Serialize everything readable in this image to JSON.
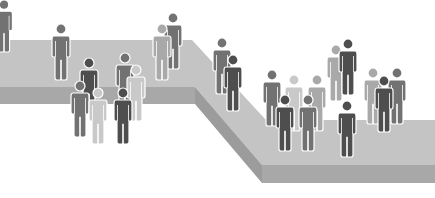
{
  "illustration": {
    "subject": "people-on-stepped-platform",
    "colors": {
      "background": "#ffffff",
      "platform_top": "#c4c4c4",
      "platform_front": "#a8a8a8",
      "platform_side": "#9c9c9c",
      "figure_outline": "#ffffff",
      "figure_dark": "#4e4e4e",
      "figure_mid": "#727272",
      "figure_light": "#a9a9a9",
      "figure_pale": "#c9c9c9"
    },
    "figures": [
      {
        "x": 4,
        "y": 0,
        "h": 52,
        "tone": "mid"
      },
      {
        "x": 61,
        "y": 24,
        "h": 56,
        "tone": "mid"
      },
      {
        "x": 173,
        "y": 13,
        "h": 56,
        "tone": "mid"
      },
      {
        "x": 162,
        "y": 24,
        "h": 56,
        "tone": "light"
      },
      {
        "x": 89,
        "y": 58,
        "h": 56,
        "tone": "dark"
      },
      {
        "x": 125,
        "y": 53,
        "h": 56,
        "tone": "mid"
      },
      {
        "x": 136,
        "y": 65,
        "h": 56,
        "tone": "pale"
      },
      {
        "x": 80,
        "y": 81,
        "h": 56,
        "tone": "mid"
      },
      {
        "x": 98,
        "y": 88,
        "h": 56,
        "tone": "pale"
      },
      {
        "x": 123,
        "y": 88,
        "h": 56,
        "tone": "dark"
      },
      {
        "x": 222,
        "y": 38,
        "h": 56,
        "tone": "mid"
      },
      {
        "x": 233,
        "y": 55,
        "h": 56,
        "tone": "dark"
      },
      {
        "x": 272,
        "y": 70,
        "h": 56,
        "tone": "mid"
      },
      {
        "x": 294,
        "y": 75,
        "h": 56,
        "tone": "pale"
      },
      {
        "x": 317,
        "y": 75,
        "h": 56,
        "tone": "light"
      },
      {
        "x": 285,
        "y": 95,
        "h": 56,
        "tone": "dark"
      },
      {
        "x": 308,
        "y": 95,
        "h": 56,
        "tone": "mid"
      },
      {
        "x": 336,
        "y": 45,
        "h": 56,
        "tone": "light"
      },
      {
        "x": 348,
        "y": 39,
        "h": 56,
        "tone": "dark"
      },
      {
        "x": 347,
        "y": 101,
        "h": 56,
        "tone": "dark"
      },
      {
        "x": 373,
        "y": 68,
        "h": 56,
        "tone": "light"
      },
      {
        "x": 397,
        "y": 68,
        "h": 56,
        "tone": "mid"
      },
      {
        "x": 384,
        "y": 76,
        "h": 56,
        "tone": "dark"
      }
    ]
  }
}
